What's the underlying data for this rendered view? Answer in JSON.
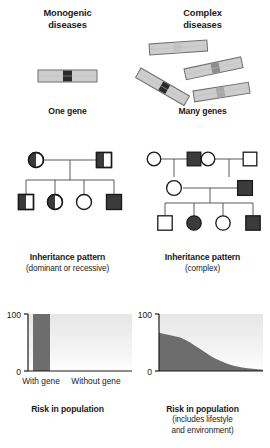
{
  "figure": {
    "colors": {
      "chromosome_body": "#cdcdcd",
      "chromosome_outline": "#6e6e6e",
      "band_dark": "#2b2b2b",
      "band_mid": "#8d8d8d",
      "band_light": "#b5b5b5",
      "symbol_fill_dark": "#3b3b3b",
      "symbol_fill_white": "#ffffff",
      "symbol_outline": "#1a1a1a",
      "pedigree_line": "#5a5a5a",
      "bar_fill": "#6d6d6d",
      "area_fill": "#6d6d6d",
      "plot_bg_top": "#e8e8e8",
      "plot_bg_bottom": "#fbfbfb",
      "axis": "#1a1a1a"
    }
  },
  "columns": {
    "left": {
      "heading_line1": "Monogenic",
      "heading_line2": "diseases",
      "gene_caption": "One gene",
      "pedigree_caption": "Inheritance pattern",
      "pedigree_subcaption": "(dominant or recessive)",
      "chart_caption": "Risk in population",
      "chart_subcaption_line1": "",
      "chart_subcaption_line2": ""
    },
    "right": {
      "heading_line1": "Complex",
      "heading_line2": "diseases",
      "gene_caption": "Many genes",
      "pedigree_caption": "Inheritance pattern",
      "pedigree_subcaption": "(complex)",
      "chart_caption": "Risk in population",
      "chart_subcaption_line1": "(includes lifestyle",
      "chart_subcaption_line2": "and environment)"
    }
  },
  "chromosomes": {
    "left": [
      {
        "name": "chromosome-single",
        "angle": 0,
        "band_color": "#2b2b2b",
        "band_position": 0.46
      }
    ],
    "right": [
      {
        "name": "chromosome-1",
        "angle": -4,
        "band_color": "#c4c4c4",
        "band_position": 0.44
      },
      {
        "name": "chromosome-2",
        "angle": -12,
        "band_color": "#8d8d8d",
        "band_position": 0.5
      },
      {
        "name": "chromosome-3",
        "angle": 30,
        "band_color": "#2b2b2b",
        "band_position": 0.5
      },
      {
        "name": "chromosome-4",
        "angle": -9,
        "band_color": "#a8a8a8",
        "band_position": 0.44
      }
    ]
  },
  "pedigrees": {
    "left": {
      "generations": [
        {
          "index": 1,
          "members": [
            {
              "id": "g1-mother",
              "shape": "circle",
              "fill": "half-left-dark"
            },
            {
              "id": "g1-father",
              "shape": "square",
              "fill": "half-left-dark"
            }
          ]
        },
        {
          "index": 2,
          "members": [
            {
              "id": "g2-child-1",
              "shape": "square",
              "fill": "half-left-dark"
            },
            {
              "id": "g2-child-2",
              "shape": "circle",
              "fill": "half-left-dark"
            },
            {
              "id": "g2-child-3",
              "shape": "circle",
              "fill": "white"
            },
            {
              "id": "g2-child-4",
              "shape": "square",
              "fill": "full-dark"
            }
          ]
        }
      ]
    },
    "right": {
      "generations": [
        {
          "index": 1,
          "members": [
            {
              "id": "g1-grandmother-a",
              "shape": "circle",
              "fill": "white"
            },
            {
              "id": "g1-grandfather-a",
              "shape": "square",
              "fill": "full-dark"
            },
            {
              "id": "g1-grandmother-b",
              "shape": "circle",
              "fill": "white"
            },
            {
              "id": "g1-grandfather-b",
              "shape": "square",
              "fill": "white"
            }
          ]
        },
        {
          "index": 2,
          "members": [
            {
              "id": "g2-mother",
              "shape": "circle",
              "fill": "white"
            },
            {
              "id": "g2-father",
              "shape": "square",
              "fill": "full-dark"
            }
          ]
        },
        {
          "index": 3,
          "members": [
            {
              "id": "g3-child-1",
              "shape": "square",
              "fill": "white"
            },
            {
              "id": "g3-child-2",
              "shape": "circle",
              "fill": "full-dark"
            },
            {
              "id": "g3-child-3",
              "shape": "circle",
              "fill": "white"
            },
            {
              "id": "g3-child-4",
              "shape": "square",
              "fill": "full-dark"
            }
          ]
        }
      ]
    }
  },
  "chart_data": [
    {
      "id": "monogenic-risk-chart",
      "type": "bar",
      "title": "Risk in population",
      "subtitle": "",
      "xlabel": "",
      "ylabel": "",
      "categories": [
        "With gene",
        "Without gene"
      ],
      "values": [
        100,
        0
      ],
      "ylim": [
        0,
        100
      ],
      "ytick_labels": [
        "0",
        "100"
      ],
      "yticks": [
        0,
        100
      ],
      "grid": false,
      "legend": false
    },
    {
      "id": "complex-risk-chart",
      "type": "area",
      "title": "Risk in population",
      "subtitle": "(includes lifestyle and environment)",
      "xlabel": "",
      "ylabel": "",
      "ylim": [
        0,
        100
      ],
      "ytick_labels": [
        "0",
        "100"
      ],
      "yticks": [
        0,
        100
      ],
      "grid": false,
      "legend": false,
      "x": [
        0,
        5,
        10,
        15,
        20,
        25,
        30,
        35,
        40,
        45,
        50,
        55,
        60,
        65,
        70,
        75,
        80,
        85,
        90,
        95,
        100
      ],
      "values": [
        67,
        65,
        63,
        61,
        59,
        55,
        50,
        44,
        38,
        32,
        26,
        21,
        17,
        13,
        10,
        8,
        6,
        5,
        4,
        3,
        2
      ]
    }
  ],
  "axis_labels": {
    "monogenic": {
      "top": "100",
      "bottom": "0",
      "cat1": "With gene",
      "cat2": "Without gene"
    },
    "complex": {
      "top": "100",
      "bottom": "0"
    }
  }
}
